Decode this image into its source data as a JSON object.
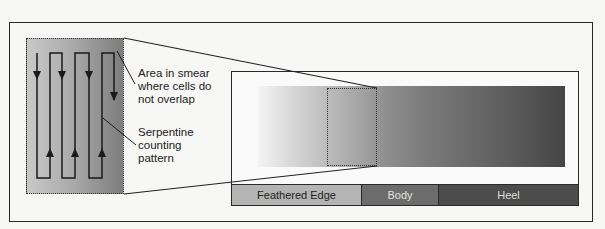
{
  "diagram": {
    "type": "blood-smear-counting-diagram",
    "callouts": {
      "non_overlap_area": "Area in smear where cells do not overlap",
      "non_overlap_lines": [
        "Area in smear",
        "where cells do",
        "not overlap"
      ],
      "serpentine": "Serpentine counting pattern",
      "serpentine_lines": [
        "Serpentine",
        "counting",
        "pattern"
      ]
    },
    "smear_regions": [
      {
        "label": "Feathered Edge",
        "color": "#b4b4b4"
      },
      {
        "label": "Body",
        "color": "#6c6c6c"
      },
      {
        "label": "Heel",
        "color": "#4c4c4c"
      }
    ],
    "icons": {
      "arrow_down": "arrow-down-icon",
      "arrow_up": "arrow-up-icon"
    }
  }
}
